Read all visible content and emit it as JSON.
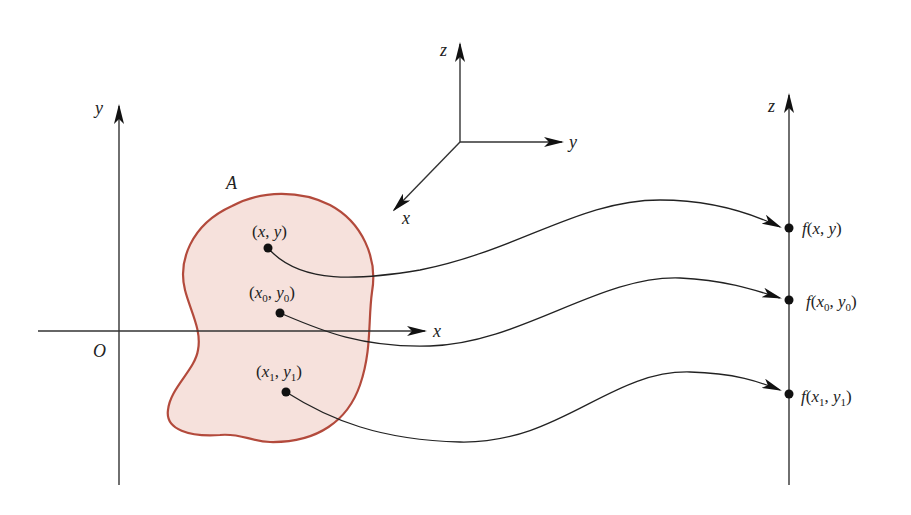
{
  "diagram": {
    "plane_axes": {
      "x_label": "x",
      "y_label": "y",
      "origin_label": "O"
    },
    "orientation_axes": {
      "x_label": "x",
      "y_label": "y",
      "z_label": "z"
    },
    "output_axis": {
      "label": "z"
    },
    "region": {
      "label": "A",
      "fill_color": "#f6e1dc",
      "stroke_color": "#b34a3c"
    },
    "points": [
      {
        "name": "(x, y)",
        "var": "x",
        "var2": "y",
        "sub": "",
        "image_fn": "f",
        "image": "f(x, y)"
      },
      {
        "name": "(x0, y0)",
        "var": "x",
        "var2": "y",
        "sub": "0",
        "image_fn": "f",
        "image": "f(x0, y0)"
      },
      {
        "name": "(x1, y1)",
        "var": "x",
        "var2": "y",
        "sub": "1",
        "image_fn": "f",
        "image": "f(x1, y1)"
      }
    ],
    "text": {
      "paren_open": "(",
      "paren_close": ")",
      "comma": ", "
    }
  }
}
